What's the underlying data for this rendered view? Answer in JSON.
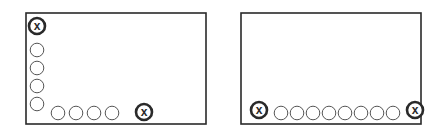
{
  "colors": {
    "stroke": "#2a2a2a",
    "light_stroke": "#555555",
    "background": "#ffffff"
  },
  "panels": [
    {
      "name": "left-panel",
      "box": {
        "x": 26,
        "y": 13,
        "w": 180,
        "h": 111
      },
      "markers": [
        {
          "type": "x",
          "cx": 37,
          "cy": 26,
          "label": "x"
        },
        {
          "type": "o",
          "cx": 37,
          "cy": 50
        },
        {
          "type": "o",
          "cx": 37,
          "cy": 68
        },
        {
          "type": "o",
          "cx": 37,
          "cy": 86
        },
        {
          "type": "o",
          "cx": 37,
          "cy": 104
        },
        {
          "type": "o",
          "cx": 58,
          "cy": 113
        },
        {
          "type": "o",
          "cx": 76,
          "cy": 113
        },
        {
          "type": "o",
          "cx": 94,
          "cy": 113
        },
        {
          "type": "o",
          "cx": 112,
          "cy": 113
        },
        {
          "type": "x",
          "cx": 144,
          "cy": 112,
          "label": "x"
        }
      ]
    },
    {
      "name": "right-panel",
      "box": {
        "x": 241,
        "y": 13,
        "w": 180,
        "h": 111
      },
      "markers": [
        {
          "type": "x",
          "cx": 259,
          "cy": 110,
          "label": "x"
        },
        {
          "type": "o",
          "cx": 281,
          "cy": 113
        },
        {
          "type": "o",
          "cx": 297,
          "cy": 113
        },
        {
          "type": "o",
          "cx": 313,
          "cy": 113
        },
        {
          "type": "o",
          "cx": 329,
          "cy": 113
        },
        {
          "type": "o",
          "cx": 345,
          "cy": 113
        },
        {
          "type": "o",
          "cx": 361,
          "cy": 113
        },
        {
          "type": "o",
          "cx": 377,
          "cy": 113
        },
        {
          "type": "o",
          "cx": 393,
          "cy": 113
        },
        {
          "type": "x",
          "cx": 415,
          "cy": 110,
          "label": "x"
        }
      ]
    }
  ]
}
